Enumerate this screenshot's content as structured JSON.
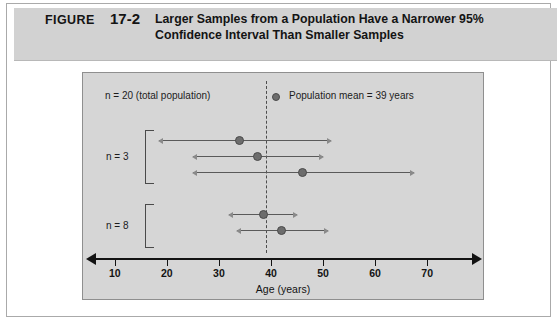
{
  "figure": {
    "label": "FIGURE",
    "number": "17-2",
    "title_line1": "Larger Samples from a Population Have a Narrower 95%",
    "title_line2": "Confidence Interval Than Smaller Samples",
    "band_color": "#d2d2d2",
    "panel_color": "#d6d6d6"
  },
  "legend": {
    "total_population": "n = 20 (total population)",
    "mean_label": "Population mean = 39 years",
    "mean_dot_name": "population-mean-dot"
  },
  "groups": [
    {
      "label": "n = 3"
    },
    {
      "label": "n = 8"
    }
  ],
  "axis": {
    "title": "Age (years)",
    "ticks": [
      10,
      20,
      30,
      40,
      50,
      60,
      70
    ],
    "min": 6,
    "max": 79
  },
  "chart_data": {
    "type": "scatter",
    "title": "Larger Samples from a Population Have a Narrower 95% Confidence Interval Than Smaller Samples",
    "xlabel": "Age (years)",
    "ylabel": "",
    "xlim": [
      6,
      79
    ],
    "grid": false,
    "legend_position": "top-right",
    "population_mean": 39,
    "population_n": 20,
    "series": [
      {
        "name": "n = 3",
        "sample_size": 3,
        "intervals": [
          {
            "mean": 34.0,
            "lower": 18.5,
            "upper": 51.5
          },
          {
            "mean": 37.5,
            "lower": 25.0,
            "upper": 50.0
          },
          {
            "mean": 46.0,
            "lower": 25.0,
            "upper": 67.5
          }
        ]
      },
      {
        "name": "n = 8",
        "sample_size": 8,
        "intervals": [
          {
            "mean": 38.5,
            "lower": 32.0,
            "upper": 45.0
          },
          {
            "mean": 42.0,
            "lower": 33.5,
            "upper": 51.0
          }
        ]
      }
    ]
  }
}
